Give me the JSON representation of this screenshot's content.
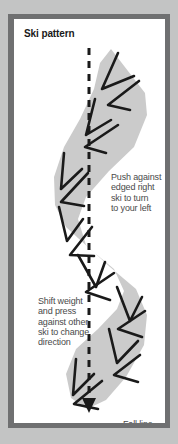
{
  "figure": {
    "title": "Ski pattern",
    "background_color": "#c3c4c4",
    "frame_color": "#6f7071",
    "panel_color": "#ffffff"
  },
  "diagram": {
    "type": "ski-turn-pattern",
    "track_color": "#c9c9c9",
    "mark_color": "#1a1a1a",
    "fall_line": {
      "style": "dashed",
      "color": "#1a1a1a",
      "label": "Fall line",
      "arrow_direction": "down"
    },
    "annotations": [
      {
        "id": "right",
        "text": "Push against\nedged right\nski to turn\nto your left"
      },
      {
        "id": "left",
        "text": "Shift weight\nand press\nagainst other\nski to change\ndirection"
      }
    ]
  }
}
